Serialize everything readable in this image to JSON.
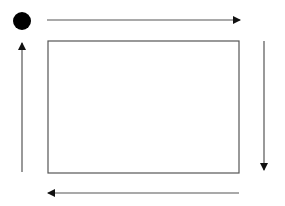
{
  "diagram": {
    "title": "",
    "colors": {
      "background": "#ffffff",
      "stroke": "#555555",
      "dot": "#000000",
      "arrowhead": "#111111"
    },
    "start_dot": {
      "cx": 22,
      "cy": 21,
      "r": 9
    },
    "rectangle": {
      "x": 48,
      "y": 41,
      "width": 191,
      "height": 132
    },
    "arrows": [
      {
        "id": "top",
        "direction": "right",
        "x1": 47,
        "y1": 20,
        "x2": 240,
        "y2": 20
      },
      {
        "id": "right",
        "direction": "down",
        "x1": 264,
        "y1": 41,
        "x2": 264,
        "y2": 170
      },
      {
        "id": "bottom",
        "direction": "left",
        "x1": 239,
        "y1": 193,
        "x2": 48,
        "y2": 193
      },
      {
        "id": "left",
        "direction": "up",
        "x1": 22,
        "y1": 172,
        "x2": 22,
        "y2": 43
      }
    ]
  }
}
